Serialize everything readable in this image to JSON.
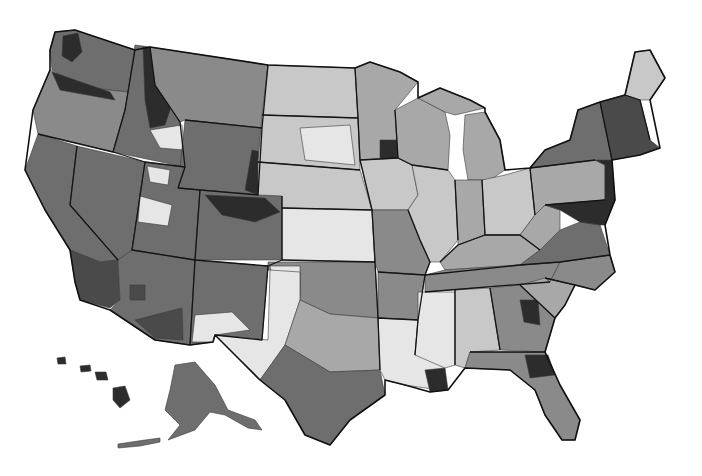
{
  "map": {
    "type": "choropleth",
    "subject": "United States hospital referral regions (grayscale shaded)",
    "legend": null,
    "title": null,
    "shades": {
      "very_light": "#e6e6e6",
      "light": "#c8c8c8",
      "medium_light": "#a8a8a8",
      "medium": "#8a8a8a",
      "medium_dark": "#6e6e6e",
      "dark": "#4a4a4a",
      "very_dark": "#2c2c2c"
    },
    "insets": [
      "Alaska",
      "Hawaii"
    ],
    "regions": [
      {
        "id": "pacific-nw",
        "shade": "medium_dark"
      },
      {
        "id": "puget-sound",
        "shade": "very_dark"
      },
      {
        "id": "oregon",
        "shade": "medium"
      },
      {
        "id": "n-california",
        "shade": "medium_dark"
      },
      {
        "id": "s-california",
        "shade": "dark"
      },
      {
        "id": "nevada",
        "shade": "medium_dark"
      },
      {
        "id": "idaho",
        "shade": "medium_dark"
      },
      {
        "id": "idaho-panhandle",
        "shade": "very_dark"
      },
      {
        "id": "montana",
        "shade": "medium"
      },
      {
        "id": "wyoming",
        "shade": "medium_dark"
      },
      {
        "id": "utah",
        "shade": "medium_dark"
      },
      {
        "id": "utah-light",
        "shade": "very_light"
      },
      {
        "id": "colorado",
        "shade": "medium_dark"
      },
      {
        "id": "colorado-front",
        "shade": "very_dark"
      },
      {
        "id": "arizona",
        "shade": "medium_dark"
      },
      {
        "id": "arizona-south",
        "shade": "dark"
      },
      {
        "id": "new-mexico",
        "shade": "medium_dark"
      },
      {
        "id": "dakotas",
        "shade": "light"
      },
      {
        "id": "south-dakota-east",
        "shade": "very_light"
      },
      {
        "id": "nebraska",
        "shade": "light"
      },
      {
        "id": "kansas",
        "shade": "very_light"
      },
      {
        "id": "oklahoma",
        "shade": "medium"
      },
      {
        "id": "texas-west",
        "shade": "very_light"
      },
      {
        "id": "texas-central",
        "shade": "medium_light"
      },
      {
        "id": "texas-south",
        "shade": "medium_dark"
      },
      {
        "id": "minnesota",
        "shade": "medium_light"
      },
      {
        "id": "iowa",
        "shade": "light"
      },
      {
        "id": "missouri",
        "shade": "medium"
      },
      {
        "id": "arkansas",
        "shade": "medium"
      },
      {
        "id": "louisiana",
        "shade": "very_light"
      },
      {
        "id": "new-orleans",
        "shade": "very_dark"
      },
      {
        "id": "wisconsin",
        "shade": "medium_light"
      },
      {
        "id": "illinois",
        "shade": "light"
      },
      {
        "id": "michigan",
        "shade": "medium_light"
      },
      {
        "id": "indiana",
        "shade": "medium_light"
      },
      {
        "id": "ohio",
        "shade": "light"
      },
      {
        "id": "kentucky",
        "shade": "medium_light"
      },
      {
        "id": "tennessee",
        "shade": "medium"
      },
      {
        "id": "mississippi",
        "shade": "very_light"
      },
      {
        "id": "alabama",
        "shade": "light"
      },
      {
        "id": "georgia",
        "shade": "medium"
      },
      {
        "id": "georgia-east",
        "shade": "very_dark"
      },
      {
        "id": "florida",
        "shade": "medium"
      },
      {
        "id": "florida-north",
        "shade": "very_dark"
      },
      {
        "id": "south-carolina",
        "shade": "medium_light"
      },
      {
        "id": "north-carolina",
        "shade": "medium"
      },
      {
        "id": "virginia",
        "shade": "medium_dark"
      },
      {
        "id": "west-virginia",
        "shade": "medium_light"
      },
      {
        "id": "pennsylvania",
        "shade": "medium_light"
      },
      {
        "id": "new-york",
        "shade": "medium_dark"
      },
      {
        "id": "new-jersey",
        "shade": "very_dark"
      },
      {
        "id": "new-england",
        "shade": "dark"
      },
      {
        "id": "maine",
        "shade": "light"
      },
      {
        "id": "alaska",
        "shade": "medium_dark"
      },
      {
        "id": "hawaii",
        "shade": "very_dark"
      }
    ]
  }
}
